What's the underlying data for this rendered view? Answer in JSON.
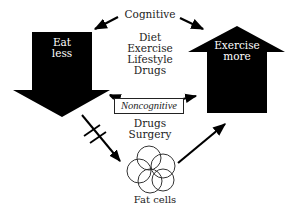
{
  "diagram": {
    "cognitive": {
      "label": "Cognitive",
      "methods": [
        "Diet",
        "Exercise",
        "Lifestyle",
        "Drugs"
      ]
    },
    "noncognitive": {
      "label": "Noncognitive",
      "methods": [
        "Drugs",
        "Surgery"
      ]
    },
    "left_arrow": {
      "label_line1": "Eat",
      "label_line2": "less",
      "direction": "down"
    },
    "right_arrow": {
      "label_line1": "Exercise",
      "label_line2": "more",
      "direction": "up"
    },
    "fat_cells": {
      "label": "Fat cells"
    },
    "connectors": [
      {
        "from": "cognitive",
        "to": "eat-less",
        "style": "arrow"
      },
      {
        "from": "cognitive",
        "to": "exercise-more",
        "style": "arrow"
      },
      {
        "from": "noncognitive",
        "to": "eat-less",
        "style": "arrow"
      },
      {
        "from": "noncognitive",
        "to": "exercise-more",
        "style": "arrow"
      },
      {
        "from": "eat-less",
        "to": "fat-cells",
        "style": "blocked-arrow"
      },
      {
        "from": "fat-cells",
        "to": "exercise-more",
        "style": "arrow"
      }
    ],
    "colors": {
      "ink": "#000000",
      "text": "#222222",
      "background": "#ffffff",
      "inverse_text": "#ffffff"
    }
  }
}
